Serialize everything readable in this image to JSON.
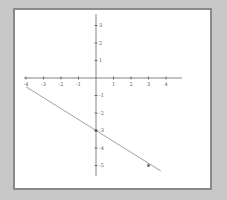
{
  "chart_data": {
    "type": "line",
    "title": "",
    "xlabel": "",
    "ylabel": "",
    "xlim": [
      -4,
      5
    ],
    "ylim": [
      -5.5,
      3.5
    ],
    "grid": false,
    "x_ticks": [
      "-4",
      "-3",
      "-2",
      "-1",
      "1",
      "2",
      "3",
      "4"
    ],
    "y_ticks": [
      "3",
      "2",
      "1",
      "-1",
      "-2",
      "-3",
      "-4",
      "-5"
    ],
    "series": [
      {
        "name": "line",
        "x": [
          -4,
          3.7
        ],
        "y": [
          -0.5,
          -5.31
        ],
        "color": "#888888"
      }
    ],
    "points": [
      {
        "x": 0,
        "y": -3,
        "label": "y-intercept"
      },
      {
        "x": 3,
        "y": -5,
        "label": "point"
      }
    ]
  }
}
